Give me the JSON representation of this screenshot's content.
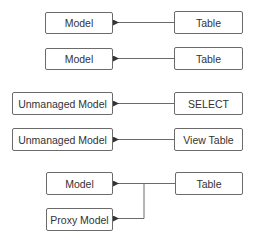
{
  "diagram": {
    "rows": [
      {
        "left": "Model",
        "right": "Table"
      },
      {
        "left": "Model",
        "right": "Table"
      },
      {
        "left": "Unmanaged Model",
        "right": "SELECT"
      },
      {
        "left": "Unmanaged Model",
        "right": "View Table"
      }
    ],
    "branch": {
      "targets": [
        "Model",
        "Proxy Model"
      ],
      "source": "Table"
    },
    "colors": {
      "line": "#6b6b6b",
      "text": "#333333"
    }
  }
}
